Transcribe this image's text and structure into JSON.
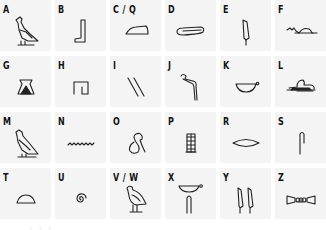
{
  "cells": [
    {
      "letter": "A",
      "glyph": "vulture-icon"
    },
    {
      "letter": "B",
      "glyph": "foot-icon"
    },
    {
      "letter": "C / Q",
      "glyph": "hill-slope-icon"
    },
    {
      "letter": "D",
      "glyph": "hand-icon"
    },
    {
      "letter": "E",
      "glyph": "reed-leaf-icon"
    },
    {
      "letter": "F",
      "glyph": "horned-viper-icon"
    },
    {
      "letter": "G",
      "glyph": "jar-stand-icon"
    },
    {
      "letter": "H",
      "glyph": "courtyard-icon"
    },
    {
      "letter": "I",
      "glyph": "double-stroke-icon"
    },
    {
      "letter": "J",
      "glyph": "cobra-icon"
    },
    {
      "letter": "K",
      "glyph": "basket-icon"
    },
    {
      "letter": "L",
      "glyph": "lion-icon"
    },
    {
      "letter": "M",
      "glyph": "owl-icon"
    },
    {
      "letter": "N",
      "glyph": "water-ripple-icon"
    },
    {
      "letter": "O",
      "glyph": "rope-loop-icon"
    },
    {
      "letter": "P",
      "glyph": "stool-icon"
    },
    {
      "letter": "R",
      "glyph": "mouth-icon"
    },
    {
      "letter": "S",
      "glyph": "folded-cloth-icon"
    },
    {
      "letter": "T",
      "glyph": "bread-loaf-icon"
    },
    {
      "letter": "U",
      "glyph": "quail-chick-spiral-icon"
    },
    {
      "letter": "V / W",
      "glyph": "quail-chick-icon"
    },
    {
      "letter": "X",
      "glyph": "basket-and-cloth-icon"
    },
    {
      "letter": "Y",
      "glyph": "double-reed-icon"
    },
    {
      "letter": "Z",
      "glyph": "door-bolt-icon"
    }
  ],
  "footer": ". . ."
}
